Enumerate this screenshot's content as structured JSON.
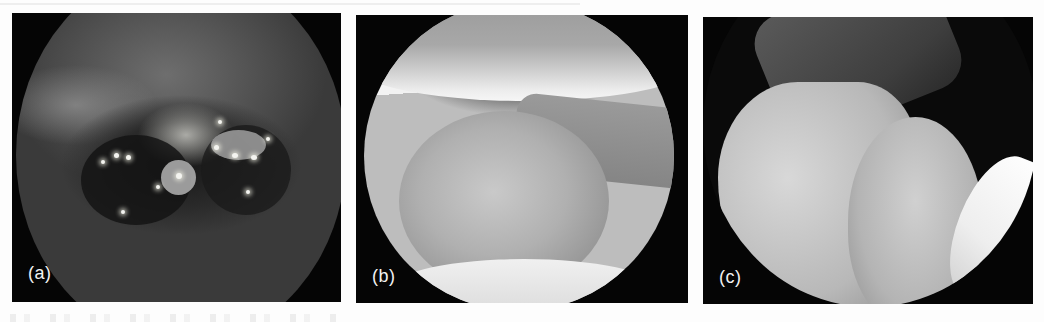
{
  "figure": {
    "panels": [
      {
        "id": "a",
        "label": "(a)",
        "description": "Endoscopic view with dark irregular lesion and bright specular highlights"
      },
      {
        "id": "b",
        "label": "(b)",
        "description": "Arthroscopic view of rounded smooth tissue mass between two bright surfaces"
      },
      {
        "id": "c",
        "label": "(c)",
        "description": "Arthroscopic view of bright curved cartilage surfaces against dark background"
      }
    ]
  },
  "colors": {
    "page_background": "#fdfdfd",
    "panel_background": "#050505",
    "label_text": "#f2f2f2"
  }
}
